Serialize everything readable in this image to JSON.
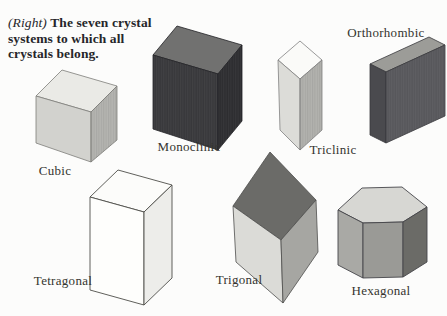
{
  "figure": {
    "background": "#fcfcfb",
    "type": "book-diagram"
  },
  "caption": {
    "prefix": "(Right)",
    "lines": [
      "The seven crystal",
      "systems to which all",
      "crystals belong."
    ]
  },
  "solids": {
    "cubic": {
      "label": "Cubic",
      "faces": {
        "top": "#eaeae6",
        "left": "#d2d2ce",
        "right": "#b5b5b1"
      }
    },
    "monoclinic": {
      "label": "Monoclinic",
      "faces": {
        "top": "#717170",
        "left": "#38383b",
        "right": "#2d2d30"
      }
    },
    "triclinic": {
      "label": "Triclinic",
      "faces": {
        "top": "#fafaf8",
        "left": "#dcdcd8",
        "right": "#b3b3af"
      }
    },
    "orthorhombic": {
      "label": "Orthorhombic",
      "faces": {
        "top": "#9c9c98",
        "left": "#4a4a4e",
        "right": "#57575b"
      }
    },
    "tetragonal": {
      "label": "Tetragonal",
      "faces": {
        "top": "#fcfcfa",
        "left": "#fefefc",
        "right": "#ededea"
      }
    },
    "trigonal": {
      "label": "Trigonal",
      "faces": {
        "top": "#6b6b68",
        "left": "#dbdbd7",
        "right": "#a6a6a2"
      }
    },
    "hexagonal": {
      "label": "Hexagonal",
      "faces": {
        "top": "#d7d7d3",
        "left": "#a9a9a5",
        "front": "#9a9a96",
        "right": "#6b6b67"
      }
    }
  }
}
